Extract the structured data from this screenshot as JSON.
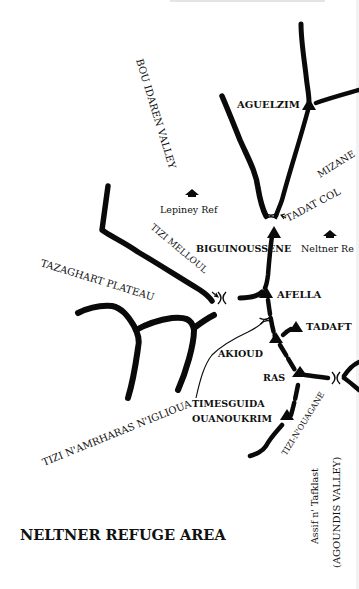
{
  "map": {
    "title": "NELTNER REFUGE AREA",
    "colors": {
      "ink": "#0a0a0a",
      "background": "#ffffff"
    },
    "valleys": [
      {
        "id": "bou-idaren",
        "label": "BOU IDAREN VALLEY"
      },
      {
        "id": "agoundis",
        "label": "(AGOUNDIS VALLEY)"
      },
      {
        "id": "assif",
        "label": "Assif n' Tafklast"
      }
    ],
    "plateaus": [
      {
        "id": "tazaghart",
        "label": "TAZAGHART PLATEAU"
      }
    ],
    "peaks": [
      {
        "id": "aguelzim",
        "label": "AGUELZIM"
      },
      {
        "id": "biguinoussene",
        "label": "BIGUINOUSSENE"
      },
      {
        "id": "afella",
        "label": "AFELLA"
      },
      {
        "id": "tadaft",
        "label": "TADAFT"
      },
      {
        "id": "akioud",
        "label": "AKIOUD"
      },
      {
        "id": "ras",
        "label": "RAS"
      },
      {
        "id": "timesguida",
        "label": "TIMESGUIDA"
      },
      {
        "id": "ouanoukrim",
        "label": "OUANOUKRIM"
      }
    ],
    "passes": [
      {
        "id": "tadat-col",
        "label": "TADAT COL"
      },
      {
        "id": "tizi-melloul",
        "label": "TIZI MELLOUL"
      },
      {
        "id": "tizi-namrharas",
        "label": "TIZI N'AMRHARAS N'IGLIOUA"
      },
      {
        "id": "tizi-nouagane",
        "label": "TIZI-N'OUAGANE"
      }
    ],
    "refuges": [
      {
        "id": "lepiney",
        "label": "Lepiney Ref"
      },
      {
        "id": "neltner",
        "label": "Neltner Re"
      }
    ],
    "regions": [
      {
        "id": "mizane",
        "label": "MIZANE"
      }
    ]
  }
}
